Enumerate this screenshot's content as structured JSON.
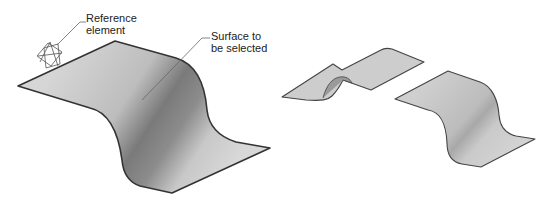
{
  "labels": {
    "reference_element": "Reference\nelement",
    "surface_to_select": "Surface to\nbe selected"
  },
  "colors": {
    "surface_light": "#d2d2d2",
    "surface_dark": "#6e6e6e",
    "outline": "#333333",
    "leader": "#555555"
  },
  "figures": [
    {
      "id": "main-surface",
      "description": "S-curved surface with reference element"
    },
    {
      "id": "result-surface-1",
      "description": "Surface with folded bump"
    },
    {
      "id": "result-surface-2",
      "description": "S-curved surface result"
    }
  ]
}
